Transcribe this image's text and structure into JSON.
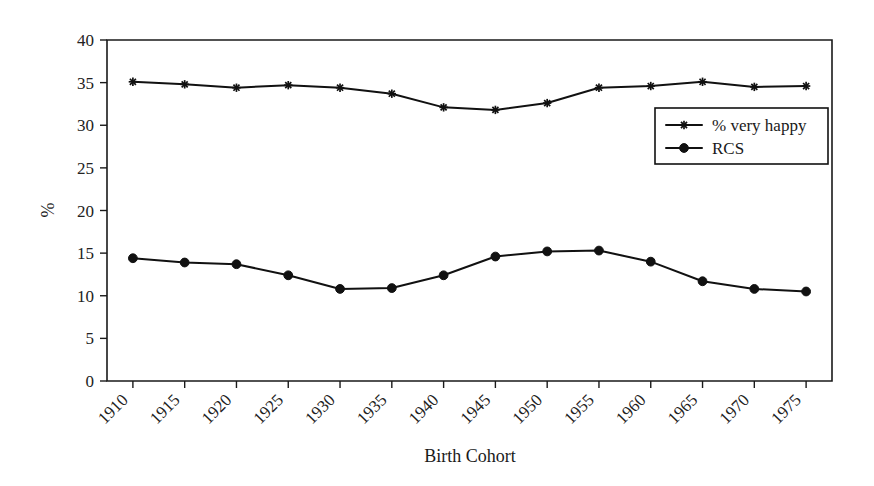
{
  "chart_data": {
    "type": "line",
    "title": "",
    "xlabel": "Birth Cohort",
    "ylabel": "%",
    "x": [
      1910,
      1915,
      1920,
      1925,
      1930,
      1935,
      1940,
      1945,
      1950,
      1955,
      1960,
      1965,
      1970,
      1975
    ],
    "xticklabels": [
      "1910",
      "1915",
      "1920",
      "1925",
      "1930",
      "1935",
      "1940",
      "1945",
      "1950",
      "1955",
      "1960",
      "1965",
      "1970",
      "1975"
    ],
    "yticklabels": [
      "0",
      "5",
      "10",
      "15",
      "20",
      "25",
      "30",
      "35",
      "40"
    ],
    "yticks": [
      0,
      5,
      10,
      15,
      20,
      25,
      30,
      35,
      40
    ],
    "ylim": [
      0,
      40
    ],
    "xlim": [
      1907.5,
      1977.5
    ],
    "grid": false,
    "legend_position": "upper-right-inside",
    "series": [
      {
        "name": "% very happy",
        "marker": "star",
        "color": "#111111",
        "values": [
          35.1,
          34.8,
          34.4,
          34.7,
          34.4,
          33.7,
          32.1,
          31.8,
          32.6,
          34.4,
          34.6,
          35.1,
          34.5,
          34.6
        ]
      },
      {
        "name": "RCS",
        "marker": "circle",
        "color": "#111111",
        "values": [
          14.4,
          13.9,
          13.7,
          12.4,
          10.8,
          10.9,
          12.4,
          14.6,
          15.2,
          15.3,
          14.0,
          11.7,
          10.8,
          10.5
        ]
      }
    ]
  },
  "legend": {
    "entries": [
      {
        "label": "% very happy"
      },
      {
        "label": "RCS"
      }
    ]
  }
}
